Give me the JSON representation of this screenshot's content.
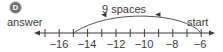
{
  "label": "D",
  "annotations": {
    "answer": "answer",
    "start": "start",
    "jump": "9 spaces"
  },
  "number_line": {
    "min": -17,
    "max": -6,
    "tick_step": 1,
    "labeled_ticks": [
      "−16",
      "−14",
      "−12",
      "−10",
      "−8",
      "−6"
    ],
    "start_value": -6,
    "answer_value": -15,
    "jump_size": 9,
    "direction": "left"
  },
  "colors": {
    "line": "#3a3a3a",
    "arc": "#555555",
    "text": "#3a3a3a",
    "badge": "#6d6d6d"
  }
}
